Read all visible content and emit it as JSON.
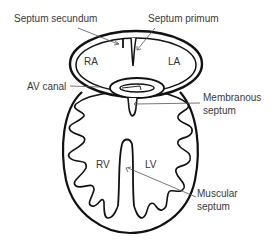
{
  "diagram": {
    "colors": {
      "stroke": "#111111",
      "leader": "#555555",
      "text": "#3a3a3a",
      "background": "#ffffff"
    },
    "labels": {
      "septum_secundum": "Septum secundum",
      "septum_primum": "Septum primum",
      "av_canal": "AV canal",
      "membranous_septum_line1": "Membranous",
      "membranous_septum_line2": "septum",
      "muscular_septum_line1": "Muscular",
      "muscular_septum_line2": "septum"
    },
    "chambers": {
      "ra": "RA",
      "la": "LA",
      "rv": "RV",
      "lv": "LV"
    }
  }
}
